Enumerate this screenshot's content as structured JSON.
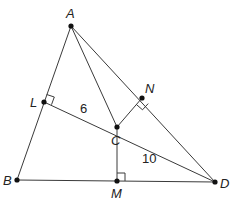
{
  "diagram": {
    "title": "",
    "points": [
      {
        "name": "A",
        "x": 71,
        "y": 26,
        "label_dx": -5,
        "label_dy": -8
      },
      {
        "name": "L",
        "x": 44,
        "y": 102,
        "label_dx": -14,
        "label_dy": 5
      },
      {
        "name": "C",
        "x": 117,
        "y": 127,
        "label_dx": -4,
        "label_dy": 18
      },
      {
        "name": "N",
        "x": 142,
        "y": 98,
        "label_dx": 3,
        "label_dy": -5
      },
      {
        "name": "B",
        "x": 17,
        "y": 180,
        "label_dx": -14,
        "label_dy": 5
      },
      {
        "name": "M",
        "x": 117,
        "y": 181,
        "label_dx": -5,
        "label_dy": 17
      },
      {
        "name": "D",
        "x": 215,
        "y": 182,
        "label_dx": 5,
        "label_dy": 6
      }
    ],
    "segments": [
      [
        "A",
        "B"
      ],
      [
        "B",
        "D"
      ],
      [
        "A",
        "D"
      ],
      [
        "A",
        "C"
      ],
      [
        "L",
        "D"
      ],
      [
        "C",
        "N"
      ],
      [
        "C",
        "M"
      ]
    ],
    "right_angles": [
      {
        "at": "L"
      },
      {
        "at": "N"
      },
      {
        "at": "M"
      }
    ],
    "measurements": [
      {
        "segment": "LC",
        "value": "6",
        "x": 80,
        "y": 113
      },
      {
        "segment": "CD",
        "value": "10",
        "x": 142,
        "y": 163
      }
    ]
  }
}
